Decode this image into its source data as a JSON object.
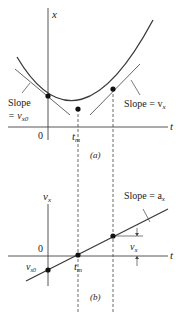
{
  "figure": {
    "panel_a": {
      "caption": "(a)",
      "y_axis_label": "x",
      "x_axis_label": "t",
      "origin_label": "0",
      "tm_label": "t",
      "tm_sub": "m",
      "left_slope_line1": "Slope",
      "left_slope_line2": "= v",
      "left_slope_sub": "x0",
      "right_slope": "Slope = v",
      "right_slope_sub": "x",
      "curve": "parabola x(t) with minimum at t_m",
      "points": [
        "(0, x0)",
        "(t_m, x_min)",
        "(t, x)"
      ]
    },
    "panel_b": {
      "caption": "(b)",
      "y_axis_label": "v",
      "y_axis_sub": "x",
      "x_axis_label": "t",
      "origin_label": "0",
      "tm_label": "t",
      "tm_sub": "m",
      "vx0_label": "v",
      "vx0_sub": "x0",
      "slope_label": "Slope = a",
      "slope_sub": "x",
      "vx_label": "v",
      "vx_sub": "x",
      "line": "straight line v_x(t), zero crossing at t_m",
      "points": [
        "(0, v_x0)",
        "(t_m, 0)",
        "(t, v_x)"
      ]
    },
    "colors": {
      "curve": "#3a3a3a",
      "tangent": "#555555",
      "axis": "#444444",
      "point": "#111111"
    }
  }
}
